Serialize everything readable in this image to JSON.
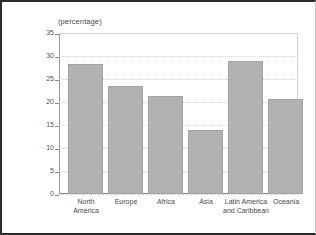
{
  "chart_data": {
    "type": "bar",
    "title": "(percentage)",
    "subtitle": "",
    "xlabel": "",
    "ylabel": "",
    "categories": [
      "North\nAmerica",
      "Europe",
      "Africa",
      "Asia",
      "Latin America\nand Caribbean",
      "Oceania"
    ],
    "values": [
      28.3,
      23.5,
      21.4,
      13.9,
      29.0,
      20.7
    ],
    "ylim": [
      0,
      35
    ],
    "yticks": [
      0,
      5,
      10,
      15,
      20,
      25,
      30,
      35
    ],
    "ytick_labels": [
      "0",
      "5",
      "10",
      "15",
      "20",
      "25",
      "30",
      "35"
    ],
    "grid": true,
    "legend": "none",
    "bar_color": "#b2b2b2",
    "bar_edge_color": "#a2a2a2",
    "axis_color": "#8d8d8d",
    "grid_color": "#d4d4d4",
    "text_color": "#4a4a4a",
    "background": "#ffffff",
    "border_color": "#2b2b2b"
  }
}
